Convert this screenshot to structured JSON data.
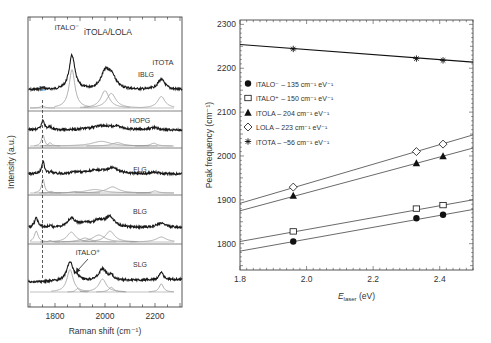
{
  "chart_data": [
    {
      "panel": "left",
      "type": "line",
      "subtype": "stacked-spectra",
      "title": "",
      "xlabel": "Raman shift (cm⁻¹)",
      "ylabel": "Intensity (a.u.)",
      "xlim": [
        1692,
        2308
      ],
      "xticks": [
        1800,
        2000,
        2200
      ],
      "grid": false,
      "annotations": [
        {
          "text": "iTALO⁻",
          "x": 1870,
          "sample": "IBLG"
        },
        {
          "text": "iTOLA/LOLA",
          "x": 2010,
          "sample": "IBLG"
        },
        {
          "text": "iTOTA",
          "x": 2225,
          "sample": "IBLG"
        },
        {
          "text": "M",
          "x": 1750,
          "sample": "IBLG"
        },
        {
          "text": "iTALO⁺",
          "x": 1900,
          "sample": "SLG",
          "arrow": true
        }
      ],
      "dashed_line_x": 1750,
      "series": [
        {
          "name": "IBLG",
          "peaks": [
            {
              "x": 1750,
              "h": 0.05,
              "w": 10
            },
            {
              "x": 1868,
              "h": 1.0,
              "w": 14
            },
            {
              "x": 2000,
              "h": 0.45,
              "w": 20
            },
            {
              "x": 2025,
              "h": 0.38,
              "w": 22
            },
            {
              "x": 2225,
              "h": 0.3,
              "w": 18
            }
          ]
        },
        {
          "name": "HOPG",
          "peaks": [
            {
              "x": 1752,
              "h": 0.6,
              "w": 7
            },
            {
              "x": 1780,
              "h": 0.18,
              "w": 8
            },
            {
              "x": 1985,
              "h": 0.25,
              "w": 45
            },
            {
              "x": 2050,
              "h": 0.18,
              "w": 25
            },
            {
              "x": 2195,
              "h": 0.15,
              "w": 15
            }
          ]
        },
        {
          "name": "FLG",
          "peaks": [
            {
              "x": 1752,
              "h": 0.8,
              "w": 7
            },
            {
              "x": 1785,
              "h": 0.1,
              "w": 8
            },
            {
              "x": 1880,
              "h": 0.08,
              "w": 20
            },
            {
              "x": 1960,
              "h": 0.2,
              "w": 45
            },
            {
              "x": 2030,
              "h": 0.35,
              "w": 30
            },
            {
              "x": 2200,
              "h": 0.12,
              "w": 15
            }
          ]
        },
        {
          "name": "BLG",
          "peaks": [
            {
              "x": 1725,
              "h": 0.55,
              "w": 9
            },
            {
              "x": 1780,
              "h": 0.08,
              "w": 8
            },
            {
              "x": 1865,
              "h": 0.5,
              "w": 20
            },
            {
              "x": 1920,
              "h": 0.2,
              "w": 25
            },
            {
              "x": 1975,
              "h": 0.35,
              "w": 30
            },
            {
              "x": 2020,
              "h": 0.55,
              "w": 22
            },
            {
              "x": 2225,
              "h": 0.25,
              "w": 25
            }
          ]
        },
        {
          "name": "SLG",
          "peaks": [
            {
              "x": 1860,
              "h": 0.95,
              "w": 15
            },
            {
              "x": 1890,
              "h": 0.15,
              "w": 8
            },
            {
              "x": 1990,
              "h": 0.55,
              "w": 18
            },
            {
              "x": 2025,
              "h": 0.2,
              "w": 12
            },
            {
              "x": 2225,
              "h": 0.35,
              "w": 10
            }
          ]
        }
      ]
    },
    {
      "panel": "right",
      "type": "scatter",
      "title": "",
      "xlabel": "E_laser (eV)",
      "xlabel_main": "E",
      "xlabel_sub": "laser",
      "xlabel_unit": " (eV)",
      "ylabel": "Peak frequency (cm⁻¹)",
      "xlim": [
        1.8,
        2.5
      ],
      "ylim": [
        1740,
        2310
      ],
      "xticks": [
        1.8,
        2.0,
        2.2,
        2.4
      ],
      "yticks": [
        1800,
        1900,
        2000,
        2100,
        2200,
        2300
      ],
      "grid": false,
      "legend_position": "upper-left",
      "x": [
        1.96,
        2.33,
        2.41
      ],
      "series": [
        {
          "name": "iTALO⁻",
          "marker": "filled-circle",
          "slope_label": "135 cm⁻¹ eV⁻¹",
          "values": [
            1805,
            1858,
            1866
          ],
          "fit": [
            [
              1.8,
              1783
            ],
            [
              2.5,
              1878
            ]
          ]
        },
        {
          "name": "iTALO⁺",
          "marker": "open-square",
          "slope_label": "150 cm⁻¹ eV⁻¹",
          "values": [
            1828,
            1880,
            1888
          ],
          "fit": [
            [
              1.8,
              1805
            ],
            [
              2.5,
              1900
            ]
          ]
        },
        {
          "name": "iTOLA",
          "marker": "filled-triangle",
          "slope_label": "204 cm⁻¹ eV⁻¹",
          "values": [
            1910,
            1984,
            2000
          ],
          "fit": [
            [
              1.8,
              1875
            ],
            [
              2.5,
              2018
            ]
          ]
        },
        {
          "name": "LOLA",
          "marker": "open-diamond",
          "slope_label": "223 cm⁻¹ eV⁻¹",
          "values": [
            1929,
            2010,
            2027
          ],
          "fit": [
            [
              1.8,
              1892
            ],
            [
              2.5,
              2048
            ]
          ]
        },
        {
          "name": "iTOTA",
          "marker": "asterisk",
          "slope_label": "−56 cm⁻¹ eV⁻¹",
          "values": [
            2244,
            2222,
            2218
          ],
          "fit": [
            [
              1.8,
              2254
            ],
            [
              2.5,
              2214
            ]
          ]
        }
      ]
    }
  ]
}
